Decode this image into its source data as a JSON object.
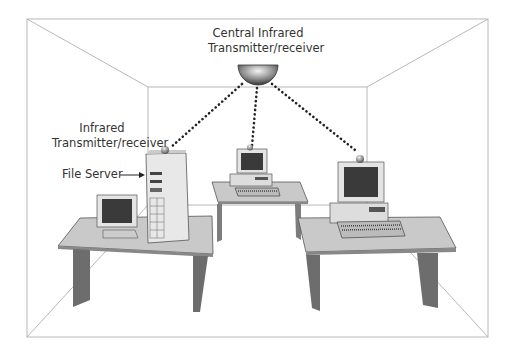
{
  "diagram": {
    "labels": {
      "central_line1": "Central Infrared",
      "central_line2": "Transmitter/receiver",
      "local_line1": "Infrared",
      "local_line2": "Transmitter/receiver",
      "file_server": "File Server"
    },
    "nodes": [
      {
        "id": "central-transceiver",
        "type": "ceiling dome"
      },
      {
        "id": "file-server",
        "type": "tower server with transceiver",
        "position": "left desk"
      },
      {
        "id": "workstation-back",
        "type": "desktop PC",
        "position": "back desk"
      },
      {
        "id": "workstation-right",
        "type": "desktop PC",
        "position": "right desk"
      }
    ],
    "links": [
      {
        "from": "central-transceiver",
        "to": "file-server",
        "style": "dotted"
      },
      {
        "from": "central-transceiver",
        "to": "workstation-back",
        "style": "dotted"
      },
      {
        "from": "central-transceiver",
        "to": "workstation-right",
        "style": "dotted"
      }
    ],
    "colors": {
      "room_line": "#b8b8b8",
      "desk_top": "#c8c8c8",
      "desk_leg": "#8a8a8a",
      "screen": "#3a3a3a",
      "dots": "#222222"
    }
  }
}
